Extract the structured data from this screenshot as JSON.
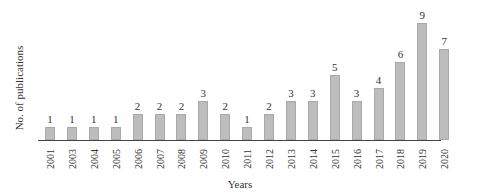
{
  "chart_data": {
    "type": "bar",
    "title": "",
    "xlabel": "Years",
    "ylabel": "No. of publications",
    "categories": [
      "2001",
      "2003",
      "2004",
      "2005",
      "2006",
      "2007",
      "2008",
      "2009",
      "2010",
      "2011",
      "2012",
      "2013",
      "2014",
      "2015",
      "2016",
      "2017",
      "2018",
      "2019",
      "2020"
    ],
    "values": [
      1,
      1,
      1,
      1,
      2,
      2,
      2,
      3,
      2,
      1,
      2,
      3,
      3,
      5,
      3,
      4,
      6,
      9,
      7
    ],
    "ylim": [
      0,
      9
    ],
    "grid": false,
    "legend": null,
    "data_labels": true,
    "bar_color": "#bdbdbd"
  }
}
